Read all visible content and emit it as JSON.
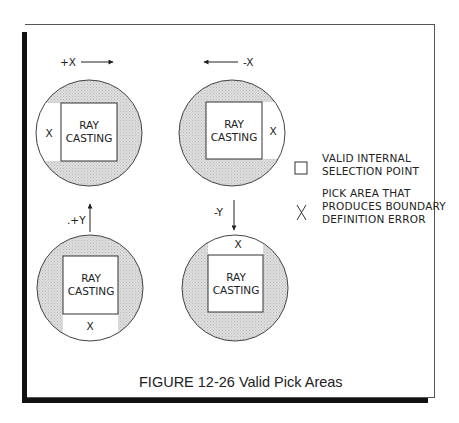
{
  "figure": {
    "caption": "FIGURE 12-26  Valid Pick Areas"
  },
  "panels": [
    {
      "id": "plus-x",
      "direction_label": "+X",
      "arrow": "right",
      "inner_label_line1": "RAY",
      "inner_label_line2": "CASTING",
      "error_marker": "X",
      "error_side": "left"
    },
    {
      "id": "minus-x",
      "direction_label": "-X",
      "arrow": "left",
      "inner_label_line1": "RAY",
      "inner_label_line2": "CASTING",
      "error_marker": "X",
      "error_side": "right"
    },
    {
      "id": "plus-y",
      "direction_label": ".+Y",
      "arrow": "up",
      "inner_label_line1": "RAY",
      "inner_label_line2": "CASTING",
      "error_marker": "X",
      "error_side": "bottom"
    },
    {
      "id": "minus-y",
      "direction_label": "-Y",
      "arrow": "down",
      "inner_label_line1": "RAY",
      "inner_label_line2": "CASTING",
      "error_marker": "X",
      "error_side": "top"
    }
  ],
  "legend": {
    "items": [
      {
        "symbol": "square",
        "line1": "VALID INTERNAL",
        "line2": "SELECTION POINT"
      },
      {
        "symbol": "X",
        "line1": "PICK AREA THAT",
        "line2": "PRODUCES BOUNDARY",
        "line3": "DEFINITION ERROR"
      }
    ]
  },
  "colors": {
    "shaded_fill": "#d4d4d4",
    "line": "#333333",
    "frame": "#111111"
  }
}
